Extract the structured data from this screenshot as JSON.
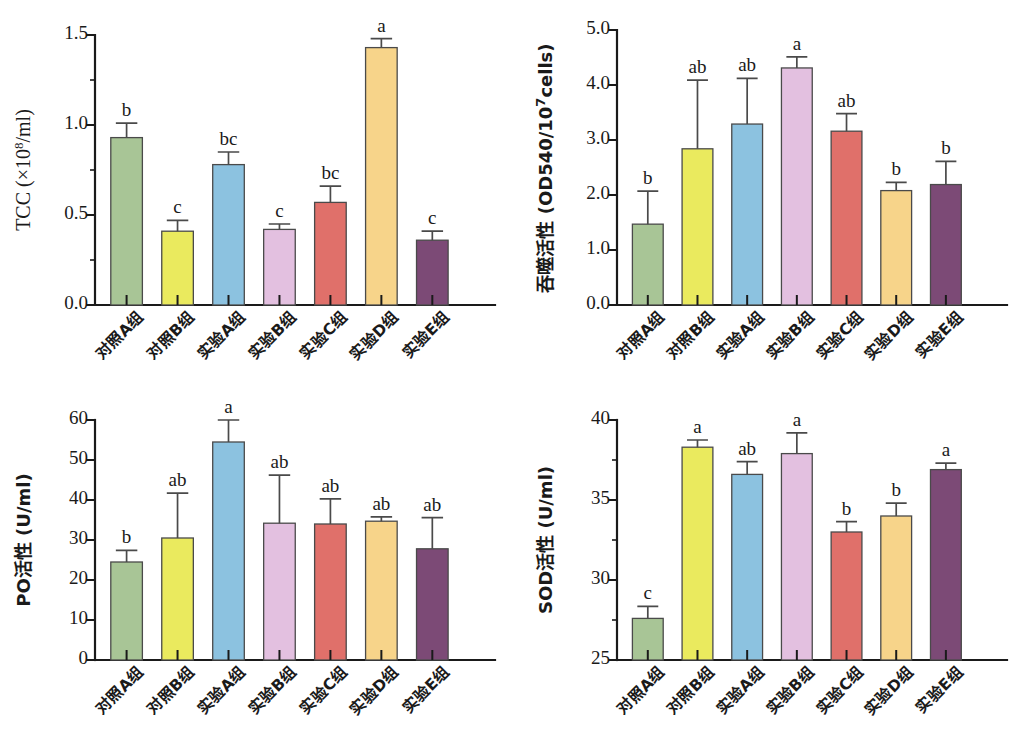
{
  "figure": {
    "categories": [
      "对照A组",
      "对照B组",
      "实验A组",
      "实验B组",
      "实验C组",
      "实验D组",
      "实验E组"
    ],
    "bar_colors": [
      "#a8c596",
      "#eaea5e",
      "#8cc2e0",
      "#e3c0e0",
      "#e0706a",
      "#f7d48a",
      "#7c4a76"
    ],
    "bar_outline": "#4a4a4a"
  },
  "chart_data": [
    {
      "type": "bar",
      "id": "tcc",
      "title": "",
      "xlabel": "",
      "ylabel": "TCC (×10⁸/ml)",
      "ylabel_base": "TCC (×10",
      "ylabel_sup": "8",
      "ylabel_tail": "/ml)",
      "categories": [
        "对照A组",
        "对照B组",
        "实验A组",
        "实验B组",
        "实验C组",
        "实验D组",
        "实验E组"
      ],
      "values": [
        0.93,
        0.41,
        0.78,
        0.42,
        0.57,
        1.43,
        0.36
      ],
      "errors": [
        0.08,
        0.06,
        0.07,
        0.03,
        0.09,
        0.05,
        0.05
      ],
      "sig_letters": [
        "b",
        "c",
        "bc",
        "c",
        "bc",
        "a",
        "c"
      ],
      "ylim": [
        0.0,
        1.5
      ],
      "yticks": [
        0.0,
        0.5,
        1.0,
        1.5
      ],
      "ytick_labels": [
        "0.0",
        "0.5",
        "1.0",
        "1.5"
      ],
      "grid": false,
      "legend": "none"
    },
    {
      "type": "bar",
      "id": "phagocytosis",
      "title": "",
      "xlabel": "",
      "ylabel": "吞噬活性 (OD540/10⁷cells)",
      "ylabel_base": "吞噬活性 (OD540/10",
      "ylabel_sup": "7",
      "ylabel_tail": "cells)",
      "categories": [
        "对照A组",
        "对照B组",
        "实验A组",
        "实验B组",
        "实验C组",
        "实验D组",
        "实验E组"
      ],
      "values": [
        1.47,
        2.84,
        3.29,
        4.31,
        3.16,
        2.08,
        2.19
      ],
      "errors": [
        0.6,
        1.25,
        0.83,
        0.2,
        0.32,
        0.15,
        0.42
      ],
      "sig_letters": [
        "b",
        "ab",
        "ab",
        "a",
        "ab",
        "b",
        "b"
      ],
      "ylim": [
        0.0,
        5.0
      ],
      "yticks": [
        0.0,
        1.0,
        2.0,
        3.0,
        4.0,
        5.0
      ],
      "ytick_labels": [
        "0.0",
        "1.0",
        "2.0",
        "3.0",
        "4.0",
        "5.0"
      ],
      "grid": false,
      "legend": "none"
    },
    {
      "type": "bar",
      "id": "po",
      "title": "",
      "xlabel": "",
      "ylabel": "PO活性 (U/ml)",
      "ylabel_base": "PO活性 (U/ml)",
      "ylabel_sup": "",
      "ylabel_tail": "",
      "categories": [
        "对照A组",
        "对照B组",
        "实验A组",
        "实验B组",
        "实验C组",
        "实验D组",
        "实验E组"
      ],
      "values": [
        24.5,
        30.5,
        54.5,
        34.2,
        34.0,
        34.7,
        27.8
      ],
      "errors": [
        2.9,
        11.2,
        5.6,
        12.0,
        6.3,
        1.1,
        7.8
      ],
      "sig_letters": [
        "b",
        "ab",
        "a",
        "ab",
        "ab",
        "ab",
        "ab"
      ],
      "ylim": [
        0,
        60
      ],
      "yticks": [
        0,
        10,
        20,
        30,
        40,
        50,
        60
      ],
      "ytick_labels": [
        "0",
        "10",
        "20",
        "30",
        "40",
        "50",
        "60"
      ],
      "grid": false,
      "legend": "none"
    },
    {
      "type": "bar",
      "id": "sod",
      "title": "",
      "xlabel": "",
      "ylabel": "SOD活性 (U/ml)",
      "ylabel_base": "SOD活性 (U/ml)",
      "ylabel_sup": "",
      "ylabel_tail": "",
      "categories": [
        "对照A组",
        "对照B组",
        "实验A组",
        "实验B组",
        "实验C组",
        "实验D组",
        "实验E组"
      ],
      "values": [
        27.6,
        38.3,
        36.6,
        37.9,
        33.0,
        34.0,
        36.9
      ],
      "errors": [
        0.75,
        0.45,
        0.8,
        1.3,
        0.65,
        0.8,
        0.4
      ],
      "sig_letters": [
        "c",
        "a",
        "ab",
        "a",
        "b",
        "b",
        "a"
      ],
      "ylim": [
        25,
        40
      ],
      "yticks": [
        25,
        30,
        35,
        40
      ],
      "ytick_labels": [
        "25",
        "30",
        "35",
        "40"
      ],
      "grid": false,
      "legend": "none"
    }
  ]
}
